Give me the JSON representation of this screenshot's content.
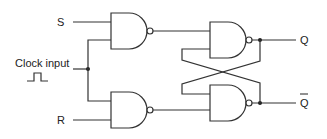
{
  "diagram": {
    "type": "clocked SR flip-flop (NAND)",
    "colors": {
      "line": "#333333",
      "background": "#ffffff"
    },
    "labels": {
      "s": "S",
      "r": "R",
      "clock": "Clock input",
      "q": "Q",
      "q_bar": "Q"
    },
    "components": [
      {
        "id": "nand-1",
        "type": "NAND",
        "inputs": [
          "S",
          "Clock"
        ],
        "output": "to nand-3"
      },
      {
        "id": "nand-2",
        "type": "NAND",
        "inputs": [
          "Clock",
          "R"
        ],
        "output": "to nand-4"
      },
      {
        "id": "nand-3",
        "type": "NAND",
        "inputs": [
          "nand-1",
          "Q-bar"
        ],
        "output": "Q"
      },
      {
        "id": "nand-4",
        "type": "NAND",
        "inputs": [
          "Q",
          "nand-2"
        ],
        "output": "Q-bar"
      }
    ]
  }
}
